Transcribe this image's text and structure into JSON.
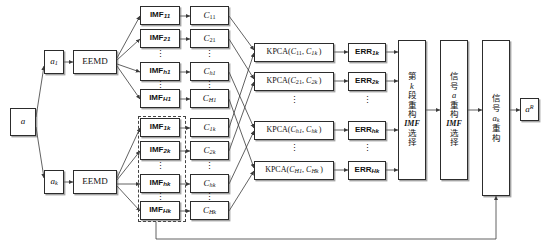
{
  "figure": {
    "background": "#ffffff",
    "line_color": "#3a3a3a",
    "box_border": "#2c2c2c"
  },
  "input": {
    "signal": "a",
    "sub": ""
  },
  "segments": [
    {
      "label": "a",
      "sub": "1"
    },
    {
      "label": "a",
      "sub": "k"
    }
  ],
  "eemd": {
    "label": "EEMD"
  },
  "imf_top": [
    {
      "base": "IMF",
      "sub": "11"
    },
    {
      "base": "IMF",
      "sub": "21"
    },
    {
      "base": "IMF",
      "sub": "h1"
    },
    {
      "base": "IMF",
      "sub": "H1"
    }
  ],
  "imf_bottom": [
    {
      "base": "IMF",
      "sub": "1k"
    },
    {
      "base": "IMF",
      "sub": "2k"
    },
    {
      "base": "IMF",
      "sub": "hk"
    },
    {
      "base": "IMF",
      "sub": "Hk"
    }
  ],
  "c_top": [
    {
      "base": "C",
      "sub": "11"
    },
    {
      "base": "C",
      "sub": "21"
    },
    {
      "base": "C",
      "sub": "h1"
    },
    {
      "base": "C",
      "sub": "H1"
    }
  ],
  "c_bottom": [
    {
      "base": "C",
      "sub": "1k"
    },
    {
      "base": "C",
      "sub": "2k"
    },
    {
      "base": "C",
      "sub": "hk"
    },
    {
      "base": "C",
      "sub": "Hk"
    }
  ],
  "kpca": [
    {
      "fn": "KPCA",
      "arg1_base": "C",
      "arg1_sub": "11",
      "arg2_base": "C",
      "arg2_sub": "1k"
    },
    {
      "fn": "KPCA",
      "arg1_base": "C",
      "arg1_sub": "21",
      "arg2_base": "C",
      "arg2_sub": "2k"
    },
    {
      "fn": "KPCA",
      "arg1_base": "C",
      "arg1_sub": "h1",
      "arg2_base": "C",
      "arg2_sub": "hk"
    },
    {
      "fn": "KPCA",
      "arg1_base": "C",
      "arg1_sub": "H1",
      "arg2_base": "C",
      "arg2_sub": "Hk"
    }
  ],
  "err": [
    {
      "base": "ERR",
      "sub": "1k"
    },
    {
      "base": "ERR",
      "sub": "2k"
    },
    {
      "base": "ERR",
      "sub": "hk"
    },
    {
      "base": "ERR",
      "sub": "Hk"
    }
  ],
  "stages": [
    {
      "name": "kth-segment-imf-selection",
      "lines": [
        "第",
        "k",
        "段",
        "重",
        "构",
        "IMF",
        "选",
        "择"
      ]
    },
    {
      "name": "signal-a-imf-selection",
      "lines": [
        "信",
        "号",
        "a",
        "重",
        "构",
        "IMF",
        "选",
        "择"
      ]
    },
    {
      "name": "signal-ak-reconstruction",
      "lines": [
        "信",
        "号",
        "a",
        "k",
        "重",
        "构"
      ]
    }
  ],
  "output": {
    "base": "a",
    "sup": "R"
  },
  "ellipsis": "⋮",
  "dashed_group_label": "kth-segment-imf-group"
}
